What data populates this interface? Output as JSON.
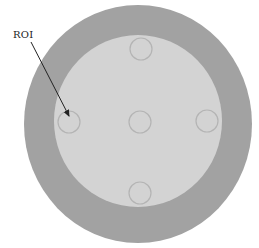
{
  "diagram": {
    "label": "ROI",
    "colors": {
      "background": "#ffffff",
      "outer_ring": "#a2a2a2",
      "inner_disc": "#d3d3d3",
      "roi_stroke": "#b4b4b4",
      "arrow": "#222222"
    },
    "outer_circle": {
      "cx": 138,
      "cy": 124,
      "rx": 114,
      "ry": 119
    },
    "inner_circle": {
      "cx": 138,
      "cy": 121,
      "rx": 84,
      "ry": 86
    },
    "rois": [
      {
        "name": "top",
        "cx": 141,
        "cy": 49,
        "r": 11
      },
      {
        "name": "left",
        "cx": 69,
        "cy": 122,
        "r": 11
      },
      {
        "name": "center",
        "cx": 140,
        "cy": 122,
        "r": 11
      },
      {
        "name": "right",
        "cx": 207,
        "cy": 121,
        "r": 11
      },
      {
        "name": "bottom",
        "cx": 140,
        "cy": 193,
        "r": 11
      }
    ],
    "arrow": {
      "x1": 31,
      "y1": 42,
      "x2": 70,
      "y2": 119
    }
  }
}
